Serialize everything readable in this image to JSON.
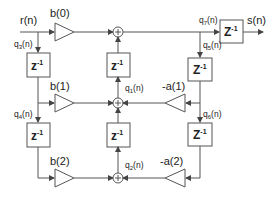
{
  "diagram": {
    "type": "IIR biquad filter block diagram (Direct Form)",
    "input": {
      "label": "r(n)"
    },
    "output": {
      "label": "s(n)"
    },
    "delay_label": {
      "base": "z",
      "exp": "-1"
    },
    "feedforward_gains": [
      {
        "id": "b0",
        "label": "b(0)"
      },
      {
        "id": "b1",
        "label": "b(1)"
      },
      {
        "id": "b2",
        "label": "b(2)"
      }
    ],
    "feedback_gains": [
      {
        "id": "a1",
        "label": "-a(1)"
      },
      {
        "id": "a2",
        "label": "-a(2)"
      }
    ],
    "signals": [
      {
        "id": "q3",
        "base": "q",
        "sub": "3",
        "tail": "(n)"
      },
      {
        "id": "q4",
        "base": "q",
        "sub": "4",
        "tail": "(n)"
      },
      {
        "id": "q1",
        "base": "q",
        "sub": "1",
        "tail": "(n)"
      },
      {
        "id": "q2",
        "base": "q",
        "sub": "2",
        "tail": "(n)"
      },
      {
        "id": "q7",
        "base": "q",
        "sub": "7",
        "tail": "(n)"
      },
      {
        "id": "q5",
        "base": "q",
        "sub": "5",
        "tail": "(n)"
      },
      {
        "id": "q6",
        "base": "q",
        "sub": "6",
        "tail": "(n)"
      }
    ],
    "adder_symbol": "+"
  }
}
